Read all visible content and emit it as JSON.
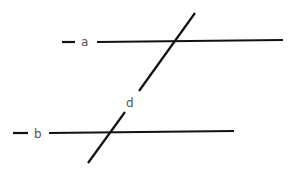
{
  "diagram": {
    "title": "",
    "line_color": "#111111",
    "label_color": "#555555",
    "labels": {
      "a": "a",
      "b": "b",
      "d": "d"
    },
    "lines": [
      {
        "name": "line-a",
        "x1": 97,
        "y1": 42,
        "x2": 283,
        "y2": 40
      },
      {
        "name": "line-a-dash",
        "x1": 62,
        "y1": 42,
        "x2": 75,
        "y2": 42
      },
      {
        "name": "line-b",
        "x1": 49,
        "y1": 133,
        "x2": 234,
        "y2": 131
      },
      {
        "name": "line-b-dash",
        "x1": 13,
        "y1": 133,
        "x2": 28,
        "y2": 133
      },
      {
        "name": "transversal-d-upper",
        "x1": 195,
        "y1": 13,
        "x2": 139,
        "y2": 91
      },
      {
        "name": "transversal-d-lower",
        "x1": 125,
        "y1": 112,
        "x2": 88,
        "y2": 163
      }
    ]
  }
}
